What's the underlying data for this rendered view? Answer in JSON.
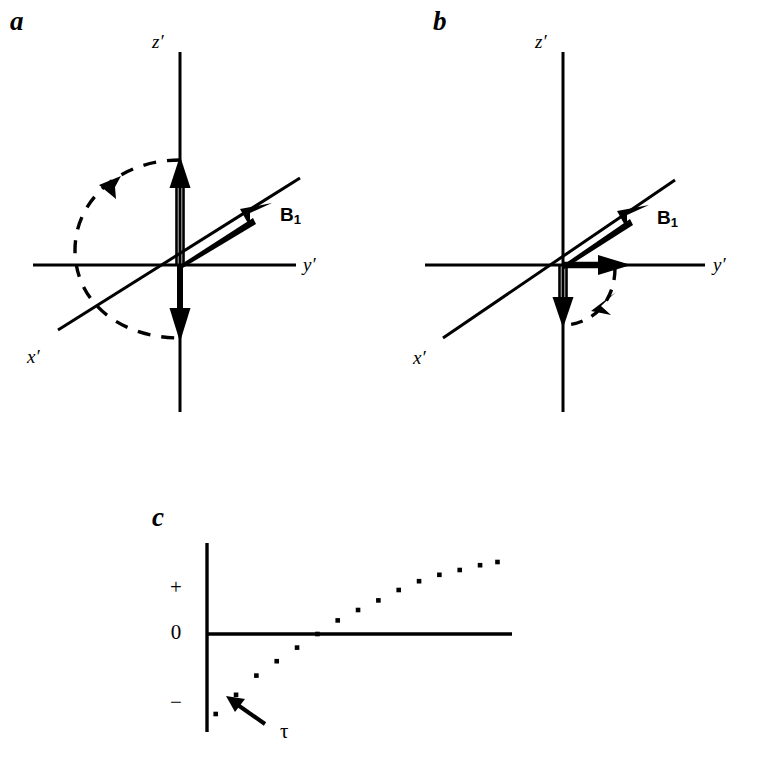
{
  "figure": {
    "background_color": "#ffffff",
    "ink_color": "#000000"
  },
  "panels": [
    {
      "id": "a",
      "letter": "a",
      "caption_position": "top-left",
      "axes": {
        "z_label": "z′",
        "y_label": "y′",
        "x_label": "x′"
      },
      "vectors": [
        {
          "name": "B1",
          "label": "B",
          "subscript": "1",
          "style": "solid-filled",
          "direction": "up-right along x'-y' diagonal"
        },
        {
          "name": "magnetization-initial",
          "style": "hollow-double-line",
          "direction": "+z"
        },
        {
          "name": "magnetization-inverted",
          "style": "solid-filled",
          "direction": "-z"
        }
      ],
      "arc": {
        "name": "rotation-arc",
        "style": "dashed",
        "sense": "180-degree inversion, counterclockwise",
        "arrowhead": "upper-left"
      }
    },
    {
      "id": "b",
      "letter": "b",
      "caption_position": "top-left",
      "axes": {
        "z_label": "z′",
        "y_label": "y′",
        "x_label": "x′"
      },
      "vectors": [
        {
          "name": "B1",
          "label": "B",
          "subscript": "1",
          "style": "solid-filled",
          "direction": "up-right along x'-y' diagonal"
        },
        {
          "name": "magnetization-initial",
          "style": "hollow-double-line",
          "direction": "-z"
        },
        {
          "name": "magnetization-rotated",
          "style": "solid-filled",
          "direction": "+y′"
        }
      ],
      "arc": {
        "name": "rotation-arc",
        "style": "dashed",
        "sense": "90-degree rotation, counterclockwise",
        "arrowhead": "right"
      }
    },
    {
      "id": "c",
      "letter": "c",
      "caption_position": "top-left",
      "annotation": {
        "name": "tau-annotation",
        "symbol": "τ",
        "arrow": "points up-left to an early negative data point"
      }
    }
  ],
  "chart_data": {
    "type": "scatter",
    "title": "",
    "xlabel": "",
    "ylabel": "",
    "ytick_labels": [
      "+",
      "0",
      "−"
    ],
    "ytick_values": [
      1,
      0,
      -1
    ],
    "xtick_labels": [],
    "grid": false,
    "legend": null,
    "axis_style": {
      "y_axis": "vertical line at left, extends above and below zero line",
      "x_axis": "horizontal line at zero level"
    },
    "marker": "small filled square dot",
    "x": [
      0.03,
      0.1,
      0.17,
      0.24,
      0.31,
      0.38,
      0.45,
      0.52,
      0.59,
      0.66,
      0.73,
      0.8,
      0.87,
      0.94,
      1.0
    ],
    "y": [
      -1.0,
      -0.76,
      -0.52,
      -0.34,
      -0.17,
      0.0,
      0.17,
      0.3,
      0.42,
      0.55,
      0.66,
      0.74,
      0.8,
      0.86,
      0.9
    ],
    "points": [
      {
        "x": 0.03,
        "y": -1.0
      },
      {
        "x": 0.1,
        "y": -0.76
      },
      {
        "x": 0.17,
        "y": -0.52
      },
      {
        "x": 0.24,
        "y": -0.34
      },
      {
        "x": 0.31,
        "y": -0.17
      },
      {
        "x": 0.38,
        "y": 0.0
      },
      {
        "x": 0.45,
        "y": 0.17
      },
      {
        "x": 0.52,
        "y": 0.3
      },
      {
        "x": 0.59,
        "y": 0.42
      },
      {
        "x": 0.66,
        "y": 0.55
      },
      {
        "x": 0.73,
        "y": 0.66
      },
      {
        "x": 0.8,
        "y": 0.74
      },
      {
        "x": 0.87,
        "y": 0.8
      },
      {
        "x": 0.94,
        "y": 0.86
      },
      {
        "x": 1.0,
        "y": 0.9
      }
    ],
    "ylim": [
      -1.15,
      1.15
    ],
    "xlim": [
      0,
      1.05
    ],
    "annotations": [
      {
        "text": "τ",
        "target_point_index": 1,
        "arrow": true
      }
    ]
  }
}
